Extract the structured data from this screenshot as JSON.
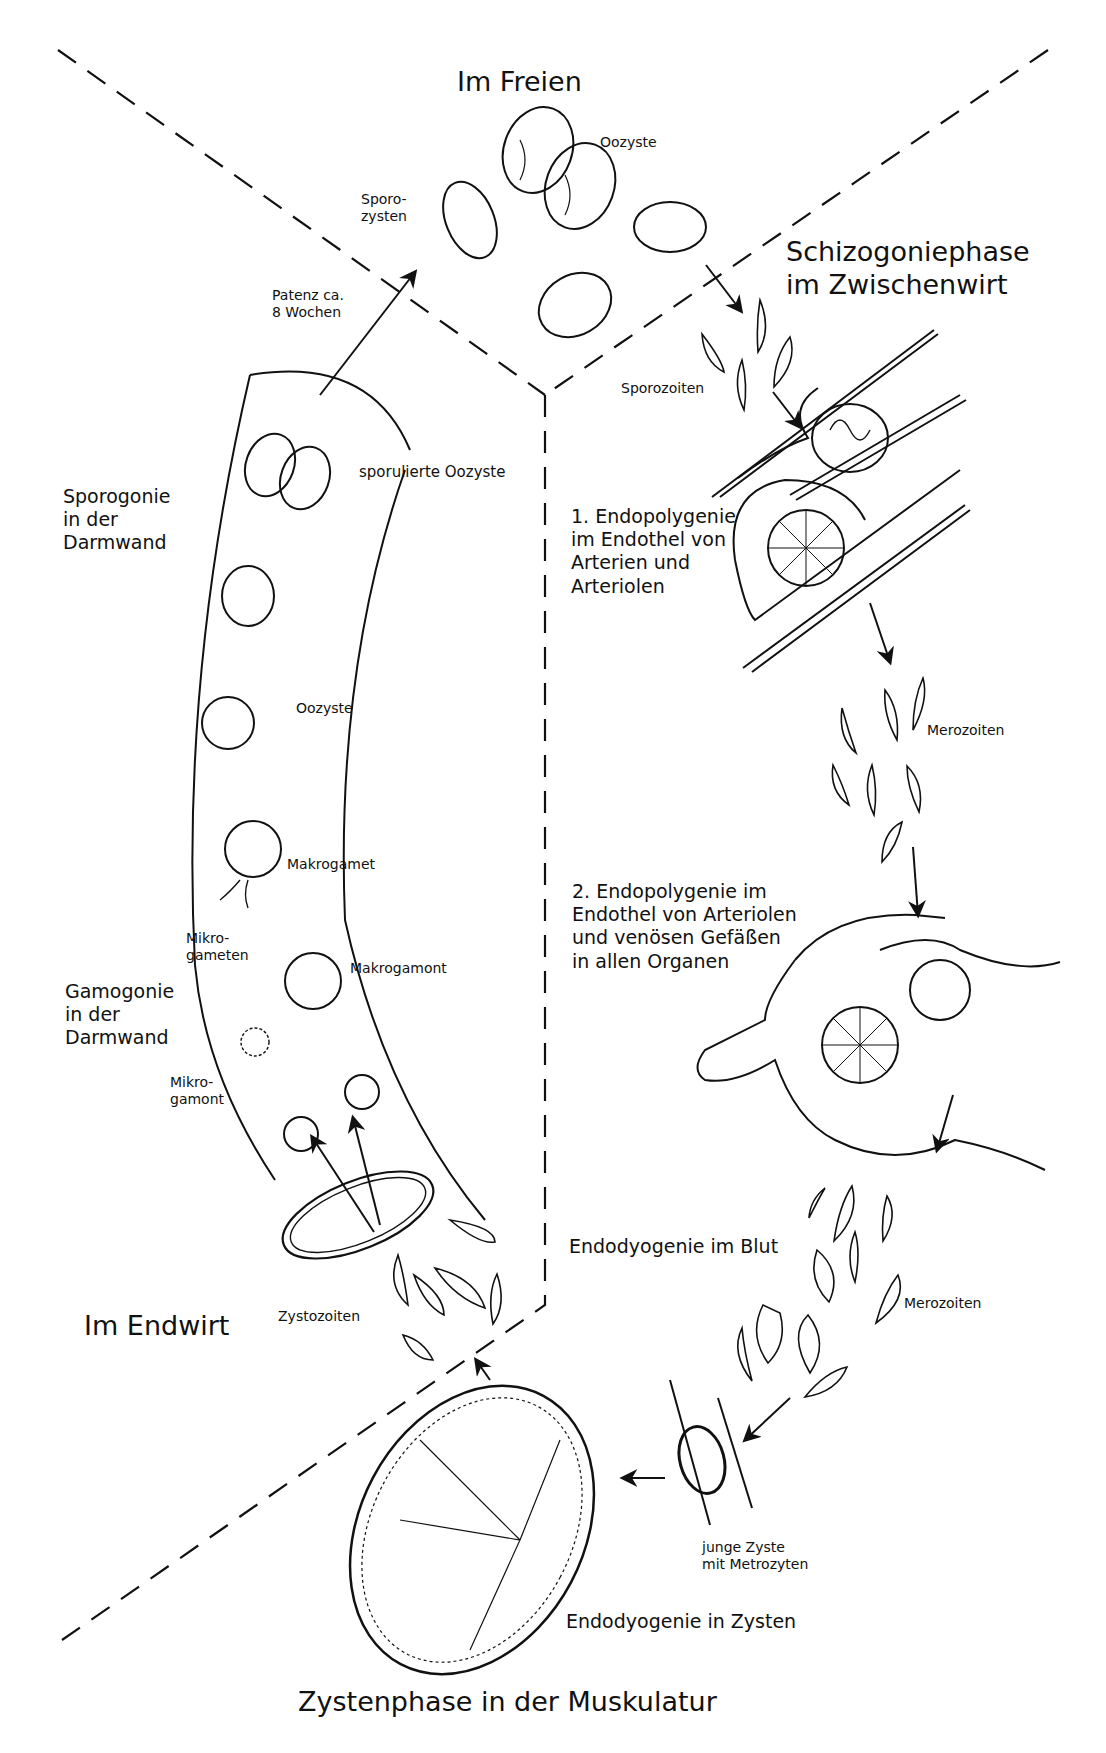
{
  "diagram": {
    "regions": {
      "top": "Im Freien",
      "right": "Schizogoniephase\nim Zwischenwirt",
      "left_bottom": "Im Endwirt",
      "bottom": "Zystenphase in der Muskulatur"
    },
    "phase_labels": {
      "sporogonie": "Sporogonie\nin der\nDarmwand",
      "gamogonie": "Gamogonie\nin der\nDarmwand",
      "endopolygenie1": "1. Endopolygenie\nim Endothel von\nArterien und\nArteriolen",
      "endopolygenie2": "2. Endopolygenie im\nEndothel von Arteriolen\nund venösen Gefäßen\nin allen Organen",
      "endodyogenie_blut": "Endodyogenie im Blut",
      "endodyogenie_zysten": "Endodyogenie in Zysten"
    },
    "stage_labels": {
      "oozyste_top": "Oozyste",
      "sporozysten": "Sporo-\nzysten",
      "patenz": "Patenz ca.\n8 Wochen",
      "sporozoiten": "Sporozoiten",
      "sporulierte_oozyste": "sporulierte Oozyste",
      "oozyste_gut": "Oozyste",
      "makrogamet": "Makrogamet",
      "mikrogameten": "Mikro-\ngameten",
      "makrogamont": "Makrogamont",
      "mikrogamont": "Mikro-\ngamont",
      "merozoiten_1": "Merozoiten",
      "merozoiten_2": "Merozoiten",
      "zystozoiten": "Zystozoiten",
      "junge_zyste": "junge Zyste\nmit Metrozyten"
    },
    "colors": {
      "ink": "#111111",
      "paper": "#ffffff"
    }
  }
}
